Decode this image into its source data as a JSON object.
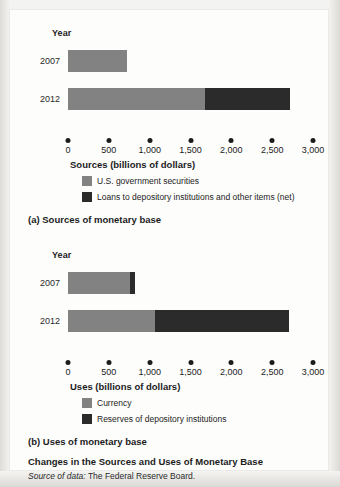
{
  "figure": {
    "title": "Changes in the Sources and Uses of Monetary Base",
    "source_label": "Source of data:",
    "source_value": "The Federal Reserve Board.",
    "year_axis_label": "Year",
    "colors": {
      "light_gray": "#828282",
      "dark": "#2b2b2b",
      "sheet": "#fdfdfc",
      "backdrop": "#f3f3f1"
    }
  },
  "panels": [
    {
      "caption": "(a) Sources of monetary base",
      "year_axis_label": "Year",
      "axis_caption": "Sources (billions of dollars)",
      "legend": [
        {
          "label": "U.S. government securities",
          "color_key": "light"
        },
        {
          "label": "Loans to depository institutions and other items (net)",
          "color_key": "dark"
        }
      ],
      "chart_data": {
        "type": "bar",
        "orientation": "horizontal",
        "stacked": true,
        "title": "(a) Sources of monetary base",
        "xlabel": "Sources (billions of dollars)",
        "ylabel": "Year",
        "categories": [
          "2007",
          "2012"
        ],
        "xlim": [
          0,
          3000
        ],
        "xticks": [
          0,
          500,
          1000,
          1500,
          2000,
          2500,
          3000
        ],
        "xtick_labels": [
          "0",
          "500",
          "1,000",
          "1,500",
          "2,000",
          "2,500",
          "3,000"
        ],
        "grid": false,
        "legend_position": "below-axis",
        "series": [
          {
            "name": "U.S. government securities",
            "color_key": "light",
            "values": [
              720,
              1680
            ]
          },
          {
            "name": "Loans to depository institutions and other items (net)",
            "color_key": "dark",
            "values": [
              0,
              1040
            ]
          }
        ],
        "totals": [
          720,
          2720
        ]
      }
    },
    {
      "caption": "(b) Uses of monetary base",
      "year_axis_label": "Year",
      "axis_caption": "Uses (billions of dollars)",
      "legend": [
        {
          "label": "Currency",
          "color_key": "light"
        },
        {
          "label": "Reserves of depository institutions",
          "color_key": "dark"
        }
      ],
      "chart_data": {
        "type": "bar",
        "orientation": "horizontal",
        "stacked": true,
        "title": "(b) Uses of monetary base",
        "xlabel": "Uses (billions of dollars)",
        "ylabel": "Year",
        "categories": [
          "2007",
          "2012"
        ],
        "xlim": [
          0,
          3000
        ],
        "xticks": [
          0,
          500,
          1000,
          1500,
          2000,
          2500,
          3000
        ],
        "xtick_labels": [
          "0",
          "500",
          "1,000",
          "1,500",
          "2,000",
          "2,500",
          "3,000"
        ],
        "grid": false,
        "legend_position": "below-axis",
        "series": [
          {
            "name": "Currency",
            "color_key": "light",
            "values": [
              760,
              1060
            ]
          },
          {
            "name": "Reserves of depository institutions",
            "color_key": "dark",
            "values": [
              60,
              1650
            ]
          }
        ],
        "totals": [
          820,
          2710
        ]
      }
    }
  ]
}
